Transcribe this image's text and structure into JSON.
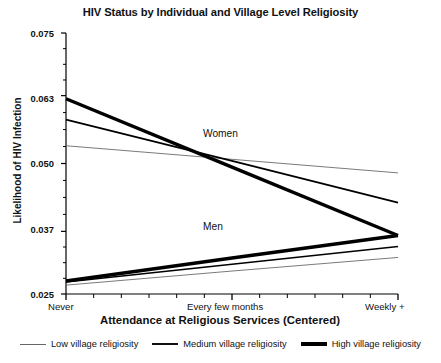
{
  "chart_data": {
    "type": "line",
    "title": "HIV Status by Individual and Village Level Religiosity",
    "xlabel": "Attendance at Religious Services (Centered)",
    "ylabel": "Likelihood of HIV Infection",
    "x_categories": [
      "Never",
      "Every few months",
      "Weekly +"
    ],
    "x_tick_labels": [
      "Never",
      "Every few months",
      "Weekly +"
    ],
    "y_tick_labels": [
      "0.075",
      "0.063",
      "0.050",
      "0.037",
      "0.025"
    ],
    "y_tick_values": [
      0.075,
      0.063,
      0.05,
      0.037,
      0.025
    ],
    "ylim": [
      0.025,
      0.075
    ],
    "xlim": [
      0,
      2
    ],
    "grid": false,
    "legend_position": "bottom",
    "annotations": [
      {
        "text": "Women",
        "x": 1.18,
        "y": 0.0565
      },
      {
        "text": "Men",
        "x": 1.12,
        "y": 0.0385
      }
    ],
    "groups": [
      {
        "name": "Women",
        "series": [
          {
            "name": "Low village religiosity",
            "weight": "thin",
            "values": [
              0.0534,
              0.0508,
              0.0482
            ]
          },
          {
            "name": "Medium village religiosity",
            "weight": "medium",
            "values": [
              0.0584,
              0.0505,
              0.0425
            ]
          },
          {
            "name": "High village religiosity",
            "weight": "thick",
            "values": [
              0.0624,
              0.0493,
              0.0362
            ]
          }
        ]
      },
      {
        "name": "Men",
        "series": [
          {
            "name": "Low village religiosity",
            "weight": "thin",
            "values": [
              0.0267,
              0.0294,
              0.032
            ]
          },
          {
            "name": "Medium village religiosity",
            "weight": "medium",
            "values": [
              0.0273,
              0.0307,
              0.0341
            ]
          },
          {
            "name": "High village religiosity",
            "weight": "thick",
            "values": [
              0.0275,
              0.0319,
              0.0362
            ]
          }
        ]
      }
    ]
  },
  "legend": {
    "items": [
      {
        "label": "Low village religiosity",
        "weight": "thin"
      },
      {
        "label": "Medium village religiosity",
        "weight": "medium"
      },
      {
        "label": "High village religiosity",
        "weight": "thick"
      }
    ]
  },
  "colors": {
    "line": "#000000",
    "line_light": "#6b6b6b",
    "axis": "#000000",
    "text": "#111111",
    "background": "#ffffff"
  }
}
